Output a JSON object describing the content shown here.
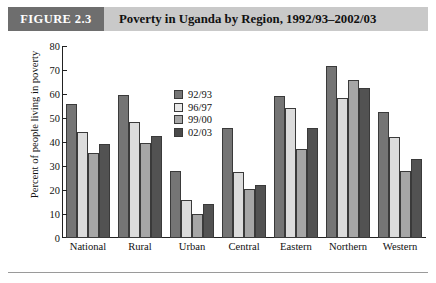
{
  "header": {
    "figure_tag": "FIGURE 2.3",
    "title": "Poverty in Uganda by Region, 1992/93–2002/03",
    "tag_bg": "#6e6e6e",
    "band_bg": "#c9c9c9"
  },
  "chart_data": {
    "type": "bar",
    "title": "Poverty in Uganda by Region, 1992/93–2002/03",
    "xlabel": "",
    "ylabel": "Percent of people living in poverty",
    "ylim": [
      0,
      80
    ],
    "yticks": [
      0,
      10,
      20,
      30,
      40,
      50,
      60,
      70,
      80
    ],
    "grid": false,
    "legend_position": "upper center",
    "categories": [
      "National",
      "Rural",
      "Urban",
      "Central",
      "Eastern",
      "Northern",
      "Western"
    ],
    "series": [
      {
        "name": "92/93",
        "color": "#757575",
        "values": [
          56,
          59.5,
          28,
          46,
          59,
          71.5,
          52.5
        ]
      },
      {
        "name": "96/97",
        "color": "#dcdcdc",
        "values": [
          44,
          48.5,
          16,
          27.5,
          54,
          58.5,
          42
        ]
      },
      {
        "name": "99/00",
        "color": "#a6a6a6",
        "values": [
          35.5,
          39.5,
          10,
          20.5,
          37,
          66,
          28
        ]
      },
      {
        "name": "02/03",
        "color": "#525252",
        "values": [
          39,
          42.5,
          14,
          22,
          46,
          62.5,
          33
        ]
      }
    ]
  }
}
